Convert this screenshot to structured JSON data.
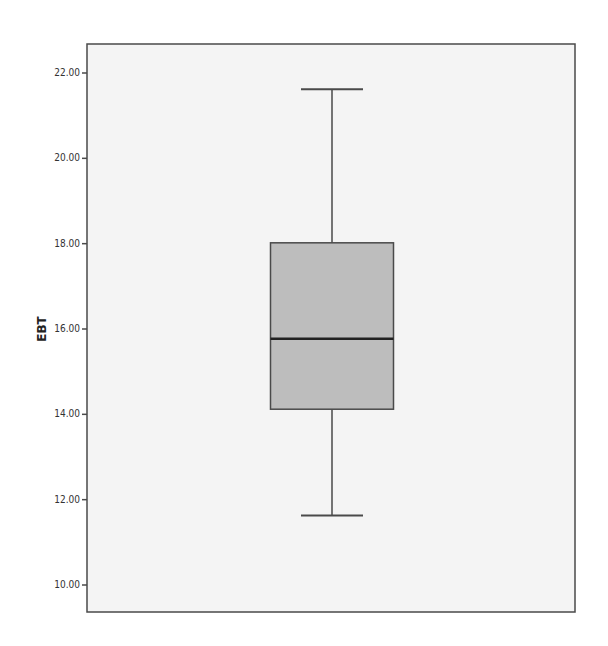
{
  "chart_data": {
    "type": "boxplot",
    "title": "",
    "xlabel": "",
    "ylabel": "EBT",
    "ylim": [
      9.4,
      22.7
    ],
    "yticks": [
      10,
      12,
      14,
      16,
      18,
      20,
      22
    ],
    "ytick_labels": [
      "10.00",
      "12.00",
      "14.00",
      "16.00",
      "18.00",
      "20.00",
      "22.00"
    ],
    "grid": false,
    "legend": null,
    "series": [
      {
        "name": "EBT",
        "whisker_low": 11.63,
        "q1": 14.12,
        "median": 15.77,
        "q3": 18.02,
        "whisker_high": 21.62,
        "outliers": []
      }
    ],
    "colors": {
      "plot_background": "#f4f4f4",
      "box_fill": "#bdbdbd",
      "box_stroke": "#4a4a4a",
      "median_line": "#222222",
      "frame": "#4a4a4a"
    }
  }
}
